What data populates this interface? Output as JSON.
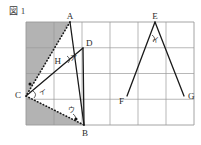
{
  "figure": {
    "caption": "図 1",
    "grid": {
      "left": 26,
      "top": 22,
      "right": 194,
      "bottom": 125,
      "cols": 6,
      "rows": 4,
      "line_color": "#9a9a9a"
    },
    "shading_color": "#b3b3b3",
    "stroke_color": "#1a1a1a",
    "points": [
      {
        "name": "A",
        "x": 70,
        "y": 22,
        "label": "A",
        "label_dx": 0,
        "label_dy": -3,
        "anchor": "middle"
      },
      {
        "name": "B",
        "x": 84,
        "y": 125,
        "label": "B",
        "label_dx": 1,
        "label_dy": 11,
        "anchor": "middle"
      },
      {
        "name": "C",
        "x": 26,
        "y": 96,
        "label": "C",
        "label_dx": -5,
        "label_dy": 2,
        "anchor": "end"
      },
      {
        "name": "D",
        "x": 83,
        "y": 48,
        "label": "D",
        "label_dx": 3,
        "label_dy": -2,
        "anchor": "start"
      },
      {
        "name": "H",
        "x": 64,
        "y": 65,
        "label": "H",
        "label_dx": -3,
        "label_dy": -1,
        "anchor": "end"
      },
      {
        "name": "E",
        "x": 155,
        "y": 22,
        "label": "E",
        "label_dx": 0,
        "label_dy": -3,
        "anchor": "middle"
      },
      {
        "name": "F",
        "x": 127,
        "y": 96,
        "label": "F",
        "label_dx": -3,
        "label_dy": 8,
        "anchor": "end"
      },
      {
        "name": "G",
        "x": 184,
        "y": 96,
        "label": "G",
        "label_dx": 4,
        "label_dy": 3,
        "anchor": "start"
      }
    ],
    "segments": [
      {
        "name": "segment-A-B",
        "x1": 70,
        "y1": 22,
        "x2": 84,
        "y2": 125,
        "style": "solid"
      },
      {
        "name": "segment-A-C",
        "x1": 70,
        "y1": 22,
        "x2": 26,
        "y2": 96,
        "style": "dotted"
      },
      {
        "name": "segment-C-D",
        "x1": 26,
        "y1": 96,
        "x2": 83,
        "y2": 48,
        "style": "solid"
      },
      {
        "name": "segment-C-B",
        "x1": 26,
        "y1": 96,
        "x2": 84,
        "y2": 125,
        "style": "dotted"
      },
      {
        "name": "segment-D-B",
        "x1": 83,
        "y1": 48,
        "x2": 84,
        "y2": 125,
        "style": "solid"
      },
      {
        "name": "segment-E-F",
        "x1": 155,
        "y1": 22,
        "x2": 127,
        "y2": 96,
        "style": "solid"
      },
      {
        "name": "segment-E-G",
        "x1": 155,
        "y1": 22,
        "x2": 184,
        "y2": 96,
        "style": "solid"
      }
    ],
    "shaded_regions": [
      {
        "name": "shaded-upper-left",
        "points": "26,22 70,22 26,96"
      },
      {
        "name": "shaded-lower-left",
        "points": "26,96 84,125 26,125"
      }
    ],
    "angle_marks": [
      {
        "name": "angle-mark-a",
        "label": "ア",
        "x": 73,
        "y": 60,
        "arc_cx": 70,
        "arc_cy": 59
      },
      {
        "name": "angle-mark-i",
        "label": "イ",
        "x": 42,
        "y": 94,
        "arc_cx": 36,
        "arc_cy": 94
      },
      {
        "name": "angle-mark-u",
        "label": "ウ",
        "x": 71,
        "y": 112,
        "arc_cx": 76,
        "arc_cy": 117
      },
      {
        "name": "angle-mark-e",
        "label": "イ",
        "x": 155,
        "y": 42,
        "arc_cx": 155,
        "arc_cy": 38
      }
    ],
    "tick_marks": [
      {
        "name": "tick-A-small",
        "x": 66,
        "y": 28
      },
      {
        "name": "tick-C-small",
        "x": 30,
        "y": 101
      }
    ],
    "dots": [
      {
        "name": "dot-left-edge",
        "x": 30,
        "y": 84
      },
      {
        "name": "dot-near-B",
        "x": 76,
        "y": 119
      }
    ]
  }
}
